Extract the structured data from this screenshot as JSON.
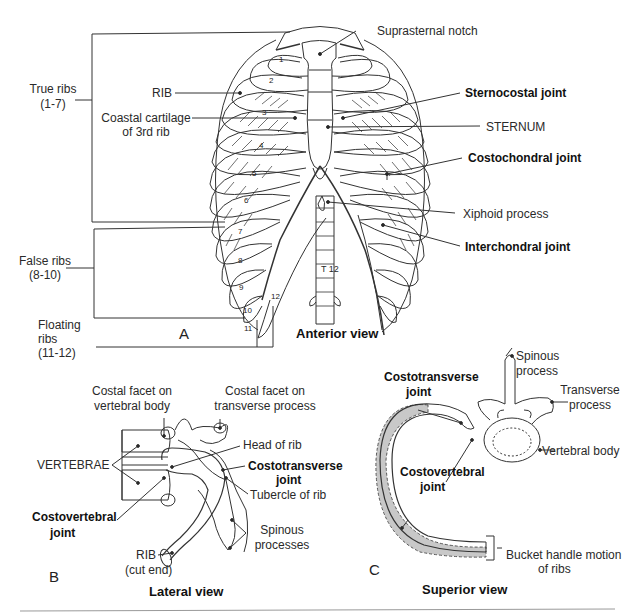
{
  "figure": {
    "panels": [
      {
        "id": "A",
        "letter": "A",
        "view_title": "Anterior view",
        "labels": {
          "suprasternal_notch": "Suprasternal notch",
          "true_ribs": "True ribs",
          "true_ribs_range": "(1-7)",
          "rib": "RIB",
          "costal_cartilage_1": "Coastal cartilage",
          "costal_cartilage_2": "of 3rd rib",
          "sternocostal_joint": "Sternocostal joint",
          "sternum": "STERNUM",
          "costochondral_joint": "Costochondral joint",
          "xiphoid_process": "Xiphoid process",
          "interchondral_joint": "Interchondral joint",
          "false_ribs": "False ribs",
          "false_ribs_range": "(8-10)",
          "floating_ribs_1": "Floating",
          "floating_ribs_2": "ribs",
          "floating_ribs_range": "(11-12)",
          "vertebra_t12": "T 12"
        },
        "rib_numbers": [
          "1",
          "2",
          "3",
          "4",
          "5",
          "6",
          "7",
          "8",
          "9",
          "10",
          "11",
          "12"
        ]
      },
      {
        "id": "B",
        "letter": "B",
        "view_title": "Lateral view",
        "labels": {
          "facet_body_1": "Costal facet on",
          "facet_body_2": "vertebral body",
          "facet_tp_1": "Costal facet on",
          "facet_tp_2": "transverse process",
          "vertebrae": "VERTEBRAE",
          "head_of_rib": "Head of rib",
          "costotransverse_1": "Costotransverse",
          "costotransverse_2": "joint",
          "tubercle": "Tubercle of rib",
          "costovertebral_1": "Costovertebral",
          "costovertebral_2": "joint",
          "spinous_1": "Spinous",
          "spinous_2": "processes",
          "rib": "RIB",
          "rib_cut": "(cut end)"
        }
      },
      {
        "id": "C",
        "letter": "C",
        "view_title": "Superior view",
        "labels": {
          "costotransverse_1": "Costotransverse",
          "costotransverse_2": "joint",
          "spinous_1": "Spinous",
          "spinous_2": "process",
          "transverse_1": "Transverse",
          "transverse_2": "process",
          "vertebral_body": "Vertebral body",
          "costovertebral_1": "Costovertebral",
          "costovertebral_2": "joint",
          "bucket_1": "Bucket handle motion",
          "bucket_2": "of ribs"
        }
      }
    ],
    "colors": {
      "line": "#333333",
      "shade": "#c8c8c8",
      "text": "#222222"
    }
  }
}
